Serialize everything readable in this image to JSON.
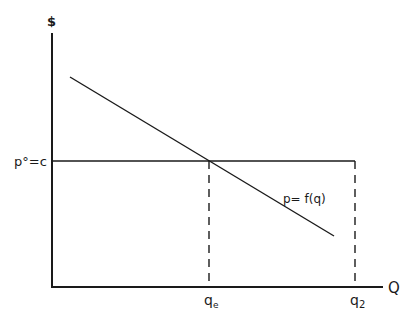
{
  "diagram": {
    "type": "economics-demand-diagram",
    "y_axis_label": "$",
    "x_axis_label": "Q",
    "price_label": "p°=c",
    "curve_label": "p= f(q)",
    "q_ticks": [
      {
        "label": "q",
        "sub": "e"
      },
      {
        "label": "q",
        "sub": "2"
      }
    ],
    "colors": {
      "ink": "#1a1a1a",
      "background": "#ffffff"
    }
  }
}
